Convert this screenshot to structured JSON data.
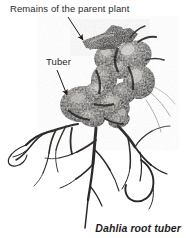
{
  "figure": {
    "name": "dahlia-root-tuber-photo",
    "background_color": "#ffffff",
    "width": 186,
    "height": 238,
    "caption": "Dahlia root tuber"
  },
  "annotations": [
    {
      "id": "parent-plant",
      "label": "Remains of the parent plant",
      "arrow": "diagonal-down-right",
      "points_to": "cut stem stub at top of tuber cluster"
    },
    {
      "id": "tuber",
      "label": "Tuber",
      "arrow": "diagonal-down-right",
      "points_to": "large swollen tuber at left of cluster"
    }
  ],
  "colors": {
    "label_text": "#2b2b2b",
    "caption_text": "#1d1d1d",
    "arrow": "#1a1a1a",
    "tuber_dark": "#2e2c2a",
    "tuber_mid": "#6f6b66",
    "tuber_light": "#cdc9c4",
    "root_dark": "#262422",
    "root_light": "#8a8682",
    "background": "#ffffff"
  }
}
